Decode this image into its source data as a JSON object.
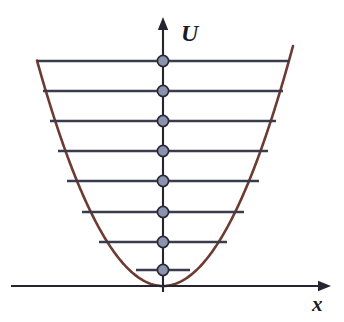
{
  "figure": {
    "background_color": "#ffffff",
    "width": 344,
    "height": 322
  },
  "axes": {
    "vertical": {
      "label": "U",
      "label_name": "y-axis-label",
      "x": 163,
      "y_top": 17,
      "y_bottom": 292,
      "color": "#262430",
      "arrow": "up"
    },
    "horizontal": {
      "label": "x",
      "label_name": "x-axis-label",
      "y": 286,
      "x_left": 11,
      "x_right": 331,
      "color": "#262430",
      "arrow": "right"
    }
  },
  "chart_data": {
    "type": "line",
    "xlabel": "x",
    "ylabel": "U",
    "grid": false,
    "legend": null,
    "axis_origin": {
      "x": 163,
      "y": 286
    },
    "potential": {
      "name": "parabolic potential U(x)",
      "shape": "parabola",
      "color": "#6d3b32",
      "vertex": {
        "x": 163,
        "y": 286
      },
      "coefficient_a": 0.0142,
      "x_min": 37,
      "x_max": 293
    },
    "levels": {
      "count": 8,
      "color": "#3a3c4e",
      "dot_color": "#8a93ad",
      "dot_outline": "#2a2835",
      "dot_radius": 5.6,
      "items": [
        {
          "n": 0,
          "y": 270,
          "half_width": 27
        },
        {
          "n": 1,
          "y": 242,
          "half_width": 64
        },
        {
          "n": 2,
          "y": 212,
          "half_width": 81
        },
        {
          "n": 3,
          "y": 181,
          "half_width": 96
        },
        {
          "n": 4,
          "y": 151,
          "half_width": 105
        },
        {
          "n": 5,
          "y": 121,
          "half_width": 113
        },
        {
          "n": 6,
          "y": 91,
          "half_width": 120
        },
        {
          "n": 7,
          "y": 61,
          "half_width": 126
        }
      ]
    }
  }
}
